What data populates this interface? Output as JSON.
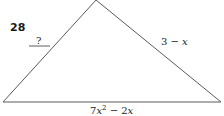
{
  "problem": {
    "number": "28",
    "labels": {
      "left_side": "?",
      "right_side_const": "3 −",
      "right_side_var": "x",
      "base_coef1": "7",
      "base_var1": "x",
      "base_exp": "2",
      "base_op": " − 2",
      "base_var2": "x"
    }
  },
  "colors": {
    "stroke": "#555555",
    "text": "#222222"
  }
}
